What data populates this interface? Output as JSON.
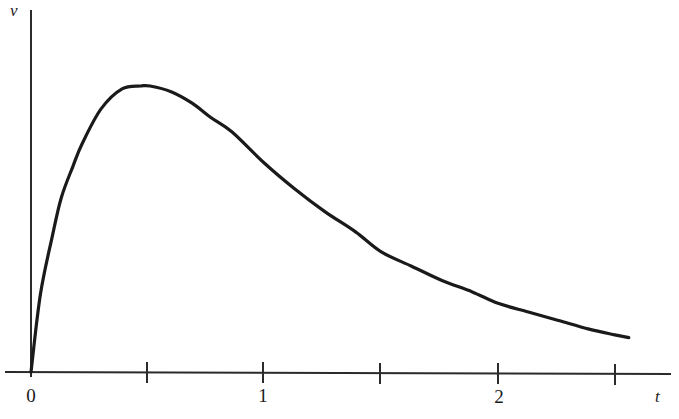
{
  "chart_data": {
    "type": "line",
    "title": "",
    "subtitle": "",
    "xlabel": "t",
    "ylabel": "v",
    "grid": false,
    "legend": null,
    "xlim": [
      0,
      2.74
    ],
    "ylim": [
      0,
      1.0
    ],
    "x_ticks": [
      {
        "value": 0,
        "label": "0",
        "px": 31
      },
      {
        "value": 0.5,
        "label": "",
        "px": 147
      },
      {
        "value": 1,
        "label": "1",
        "px": 263
      },
      {
        "value": 1.5,
        "label": "",
        "px": 380
      },
      {
        "value": 2,
        "label": "2",
        "px": 498
      },
      {
        "value": 2.5,
        "label": "",
        "px": 615
      }
    ],
    "y_ticks": [],
    "series": [
      {
        "name": "v(t)",
        "color": "#1a1a1a",
        "linewidth": 3.2,
        "x": [
          0.0,
          0.04,
          0.09,
          0.13,
          0.18,
          0.22,
          0.3,
          0.39,
          0.47,
          0.51,
          0.6,
          0.69,
          0.77,
          0.86,
          1.0,
          1.13,
          1.26,
          1.39,
          1.5,
          1.63,
          1.76,
          1.89,
          2.0,
          2.13,
          2.26,
          2.39,
          2.5,
          2.56
        ],
        "y": [
          0.0,
          0.27,
          0.47,
          0.61,
          0.72,
          0.8,
          0.92,
          0.99,
          1.0,
          1.0,
          0.98,
          0.94,
          0.89,
          0.84,
          0.73,
          0.64,
          0.56,
          0.49,
          0.42,
          0.37,
          0.32,
          0.28,
          0.24,
          0.21,
          0.18,
          0.15,
          0.13,
          0.12
        ]
      }
    ],
    "annotations": []
  },
  "axes": {
    "y_axis_label": "v",
    "x_axis_label": "t",
    "origin_label": "0",
    "tick_labels": [
      "0",
      "1",
      "2"
    ]
  },
  "colors": {
    "curve": "#1a1a1a",
    "axis": "#2b2b2b",
    "background": "#ffffff",
    "text": "#1a1a1a"
  }
}
